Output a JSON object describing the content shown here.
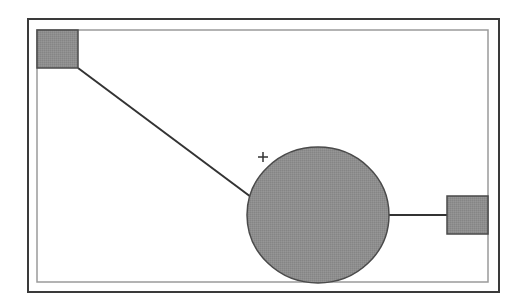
{
  "diagram": {
    "type": "node-link",
    "colors": {
      "background": "#ffffff",
      "outer_frame": "#3a3a3a",
      "inner_frame": "#9a9a9a",
      "node_fill": "#8c8c8c",
      "node_stroke": "#4a4a4a",
      "edge": "#333333",
      "marker": "#333333"
    },
    "frames": {
      "outer": {
        "x": 28,
        "y": 19,
        "width": 471,
        "height": 273
      },
      "inner": {
        "x": 37,
        "y": 30,
        "width": 451,
        "height": 252
      }
    },
    "nodes": [
      {
        "id": "square-top-left",
        "shape": "rect",
        "x": 37,
        "y": 30,
        "width": 41,
        "height": 38
      },
      {
        "id": "circle-center",
        "shape": "ellipse",
        "cx": 318,
        "cy": 215,
        "rx": 71,
        "ry": 68
      },
      {
        "id": "square-right",
        "shape": "rect",
        "x": 447,
        "y": 196,
        "width": 41,
        "height": 38
      }
    ],
    "edges": [
      {
        "from": "square-top-left",
        "to": "circle-center",
        "x1": 78,
        "y1": 68,
        "x2": 251,
        "y2": 197
      },
      {
        "from": "circle-center",
        "to": "square-right",
        "x1": 389,
        "y1": 215,
        "x2": 447,
        "y2": 215
      }
    ],
    "markers": [
      {
        "id": "plus-marker",
        "symbol": "+",
        "cx": 263,
        "cy": 157,
        "size": 10
      }
    ]
  }
}
